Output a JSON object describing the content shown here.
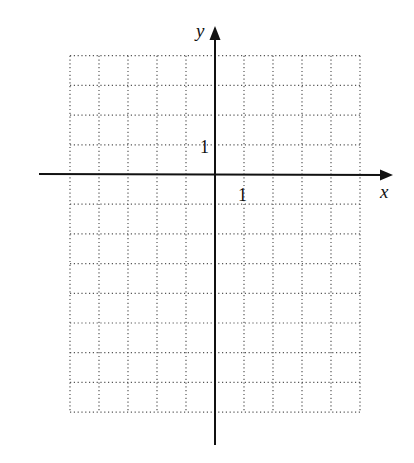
{
  "figure": {
    "type": "coordinate-grid",
    "x_axis_label": "x",
    "y_axis_label": "y",
    "x_unit_label": "1",
    "y_unit_label": "1"
  },
  "grid": {
    "x_min": -5,
    "x_max": 5,
    "y_min": -8,
    "y_max": 4,
    "step": 1,
    "line_style": "dotted",
    "line_color": "#555555"
  },
  "axes": {
    "color": "#111111",
    "x_arrow": "right",
    "y_arrow": "up"
  }
}
